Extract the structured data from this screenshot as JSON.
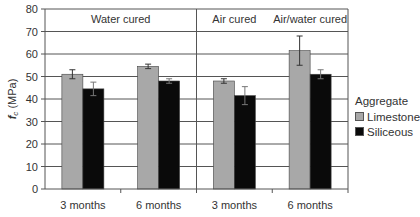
{
  "chart_data": {
    "type": "bar",
    "title": "",
    "xlabel": "",
    "ylabel": "f_c (MPa)",
    "ylabel_main": "f",
    "ylabel_sub": "c",
    "ylabel_unit": "(MPa)",
    "ylim": [
      0,
      80
    ],
    "yticks": [
      0,
      10,
      20,
      30,
      40,
      50,
      60,
      70,
      80
    ],
    "grid": true,
    "legend_position": "right",
    "legend_title": "Aggregate",
    "categories": [
      "3 months",
      "6 months",
      "3 months",
      "6 months"
    ],
    "panels": [
      {
        "label": "Water cured",
        "categories": [
          0,
          1
        ]
      },
      {
        "label": "Air cured",
        "categories": [
          2
        ]
      },
      {
        "label": "Air/water cured",
        "categories": [
          3
        ]
      }
    ],
    "series": [
      {
        "name": "Limestone",
        "color": "#a8a8a8",
        "values": [
          51,
          54.5,
          48,
          61.5
        ],
        "errors": [
          2,
          1,
          1,
          6.5
        ]
      },
      {
        "name": "Siliceous",
        "color": "#0a0a0a",
        "values": [
          44.5,
          48,
          41.5,
          51
        ],
        "errors": [
          3,
          1,
          4,
          2
        ]
      }
    ]
  }
}
